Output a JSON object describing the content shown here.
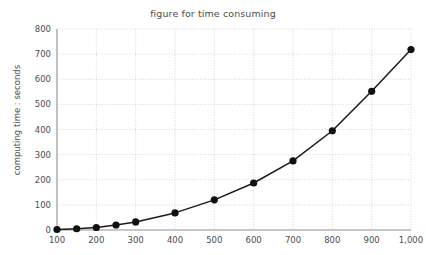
{
  "chart_data": {
    "type": "line",
    "title": "figure for time consuming",
    "xlabel": "",
    "ylabel": "computing time : seconds",
    "x": [
      100,
      150,
      200,
      250,
      300,
      400,
      500,
      600,
      700,
      800,
      900,
      1000
    ],
    "values": [
      2,
      5,
      10,
      20,
      32,
      68,
      120,
      187,
      275,
      395,
      552,
      718
    ],
    "series": [
      {
        "name": "computing time",
        "values": [
          2,
          5,
          10,
          20,
          32,
          68,
          120,
          187,
          275,
          395,
          552,
          718
        ]
      }
    ],
    "xlim": [
      100,
      1000
    ],
    "ylim": [
      0,
      800
    ],
    "x_tick_labels": [
      "100",
      "200",
      "300",
      "400",
      "500",
      "600",
      "700",
      "800",
      "900",
      "1,000"
    ],
    "x_tick_values": [
      100,
      200,
      300,
      400,
      500,
      600,
      700,
      800,
      900,
      1000
    ],
    "y_tick_labels": [
      "0",
      "100",
      "200",
      "300",
      "400",
      "500",
      "600",
      "700",
      "800"
    ],
    "y_tick_values": [
      0,
      100,
      200,
      300,
      400,
      500,
      600,
      700,
      800
    ],
    "grid": true,
    "grid_style": "dotted",
    "legend": "none",
    "marker": "filled-circle",
    "line_color": "#1a1a1a",
    "marker_color": "#111111",
    "grid_color": "#cccccc",
    "axis_color": "#b5b5b5",
    "text_color": "#4d4d4d",
    "background": "#ffffff"
  }
}
